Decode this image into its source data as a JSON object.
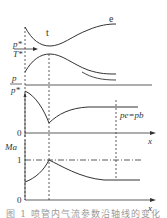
{
  "diagram": {
    "type": "laval_nozzle_flow_distribution",
    "nozzle": {
      "throat_label": "t",
      "exit_label": "e",
      "inlet_label_num": "p*",
      "inlet_label_den": "T*"
    },
    "pressure_panel": {
      "ylabel_num": "p",
      "ylabel_den": "p*",
      "zero_label": "0",
      "xlabel": "x",
      "exit_condition": "pe=pb"
    },
    "mach_panel": {
      "ylabel": "Ma",
      "tick_one": "1",
      "zero_label": "0",
      "xlabel": "x"
    },
    "caption": "图 1  喷管内气流参数沿轴线的变化"
  },
  "colors": {
    "line": "#333333",
    "background": "#ffffff"
  }
}
